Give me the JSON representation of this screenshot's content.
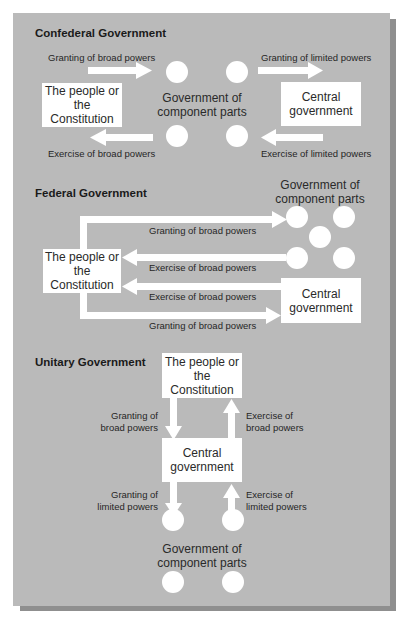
{
  "diagram": {
    "confederal": {
      "title": "Confederal Government",
      "people_box": "The people or the Constitution",
      "people_box_line1": "The people or",
      "people_box_line2": "the Constitution",
      "component_label_line1": "Government of",
      "component_label_line2": "component parts",
      "central_box_line1": "Central",
      "central_box_line2": "government",
      "arrow_labels": {
        "top_left": "Granting of broad powers",
        "top_right": "Granting of limited powers",
        "bottom_left": "Exercise of broad powers",
        "bottom_right": "Exercise of limited powers"
      },
      "component_circles": 4
    },
    "federal": {
      "title": "Federal Government",
      "component_label_line1": "Government of",
      "component_label_line2": "component parts",
      "people_box_line1": "The people or",
      "people_box_line2": "the Constitution",
      "central_box_line1": "Central",
      "central_box_line2": "government",
      "arrow_labels": {
        "granting_to_components": "Granting of broad powers",
        "exercise_from_components": "Exercise of broad powers",
        "exercise_from_central": "Exercise of broad powers",
        "granting_to_central": "Granting of broad powers"
      },
      "component_circles": 5
    },
    "unitary": {
      "title": "Unitary Government",
      "people_box_line1": "The people or",
      "people_box_line2": "the Constitution",
      "central_box_line1": "Central",
      "central_box_line2": "government",
      "component_label_line1": "Government of",
      "component_label_line2": "component parts",
      "arrow_labels": {
        "granting_broad_line1": "Granting of",
        "granting_broad_line2": "broad powers",
        "exercise_broad_line1": "Exercise of",
        "exercise_broad_line2": "broad powers",
        "granting_limited_line1": "Granting of",
        "granting_limited_line2": "limited powers",
        "exercise_limited_line1": "Exercise of",
        "exercise_limited_line2": "limited powers"
      },
      "component_circles": 4
    },
    "colors": {
      "panel": "#bababa",
      "shadow": "#8f8f8f",
      "shapes": "#ffffff",
      "text": "#1e1e1e"
    }
  }
}
